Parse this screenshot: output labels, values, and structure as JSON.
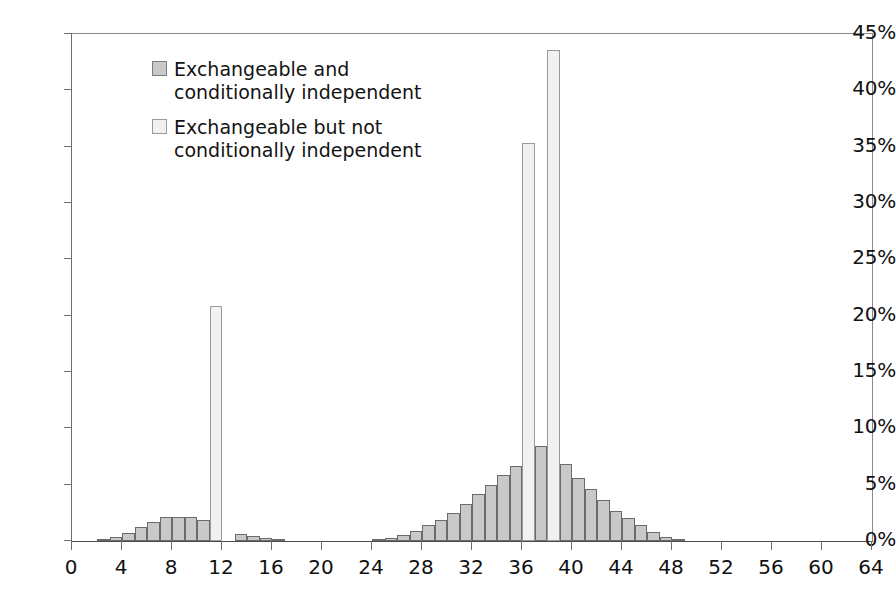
{
  "chart_data": {
    "type": "bar",
    "title": "",
    "subtitle": "",
    "xlabel": "",
    "ylabel": "",
    "xlim": [
      0,
      64
    ],
    "ylim": [
      0,
      45
    ],
    "y_tick_step": 5,
    "x_tick_step": 4,
    "grid": false,
    "y_tick_labels": [
      "45%",
      "40%",
      "35%",
      "30%",
      "25%",
      "20%",
      "15%",
      "10%",
      "5%",
      "0%"
    ],
    "y_tick_values": [
      45,
      40,
      35,
      30,
      25,
      20,
      15,
      10,
      5,
      0
    ],
    "x_tick_labels": [
      "0",
      "4",
      "8",
      "12",
      "16",
      "20",
      "24",
      "28",
      "32",
      "36",
      "40",
      "44",
      "48",
      "52",
      "56",
      "60",
      "64"
    ],
    "x_tick_values": [
      0,
      4,
      8,
      12,
      16,
      20,
      24,
      28,
      32,
      36,
      40,
      44,
      48,
      52,
      56,
      60,
      64
    ],
    "bin_width": 1,
    "legend_position": "inside-top-left",
    "colors": {
      "series0": "#c9c9c9",
      "series1": "#f1f1f1",
      "bar_outline": "#6b6b6b",
      "axis": "#6e6e6e",
      "text": "#111111",
      "background": "#ffffff"
    },
    "series": [
      {
        "name": "Exchangeable and conditionally independent",
        "color": "#c9c9c9",
        "x": [
          2,
          3,
          4,
          5,
          6,
          7,
          8,
          9,
          10,
          11,
          12,
          13,
          14,
          15,
          16,
          24,
          25,
          26,
          27,
          28,
          29,
          30,
          31,
          32,
          33,
          34,
          35,
          36,
          37,
          38,
          39,
          40,
          41,
          42,
          43,
          44,
          45,
          46,
          47,
          48
        ],
        "values": [
          0.15,
          0.35,
          0.75,
          1.2,
          1.7,
          2.1,
          2.15,
          2.15,
          1.9,
          1.5,
          0.0,
          0.6,
          0.45,
          0.25,
          0.1,
          0.15,
          0.3,
          0.55,
          0.9,
          1.4,
          1.9,
          2.5,
          3.3,
          4.2,
          5.0,
          5.9,
          6.7,
          7.5,
          8.4,
          0.0,
          6.8,
          5.6,
          4.6,
          3.6,
          2.7,
          2.0,
          1.4,
          0.8,
          0.4,
          0.15
        ]
      },
      {
        "name": "Exchangeable but not conditionally independent",
        "color": "#f1f1f1",
        "x": [
          11,
          36,
          38
        ],
        "values": [
          20.9,
          35.3,
          43.6
        ]
      }
    ],
    "annotations": []
  },
  "legend": {
    "entries": [
      {
        "label": "Exchangeable and\nconditionally independent",
        "swatch": "series0"
      },
      {
        "label": "Exchangeable but not\nconditionally independent",
        "swatch": "series1"
      }
    ]
  }
}
